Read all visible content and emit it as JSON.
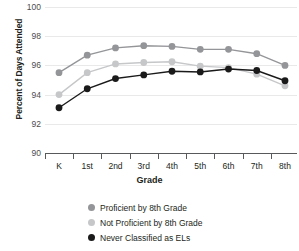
{
  "chart_data": {
    "type": "line",
    "title": "",
    "xlabel": "Grade",
    "ylabel": "Percent of Days Attended",
    "categories": [
      "K",
      "1st",
      "2nd",
      "3rd",
      "4th",
      "5th",
      "6th",
      "7th",
      "8th"
    ],
    "ylim": [
      90,
      100
    ],
    "yticks": [
      90,
      92,
      94,
      96,
      98,
      100
    ],
    "grid": true,
    "legend_position": "bottom",
    "series": [
      {
        "name": "Proficient by 8th Grade",
        "color": "#949598",
        "values": [
          95.5,
          96.7,
          97.2,
          97.35,
          97.3,
          97.1,
          97.1,
          96.8,
          96.0
        ]
      },
      {
        "name": "Not Proficient by 8th Grade",
        "color": "#c6c7c9",
        "values": [
          94.0,
          95.5,
          96.1,
          96.2,
          96.25,
          95.95,
          95.85,
          95.4,
          94.6
        ]
      },
      {
        "name": "Never Classified as ELs",
        "color": "#1a1a1a",
        "values": [
          93.1,
          94.4,
          95.1,
          95.35,
          95.6,
          95.55,
          95.75,
          95.65,
          94.95
        ]
      }
    ]
  },
  "axes": {
    "y_title": "Percent of Days Attended",
    "x_title": "Grade",
    "y_tick_labels": [
      "100",
      "98",
      "96",
      "94",
      "92",
      "90"
    ],
    "x_tick_labels": [
      "K",
      "1st",
      "2nd",
      "3rd",
      "4th",
      "5th",
      "6th",
      "7th",
      "8th"
    ]
  },
  "legend": {
    "items": [
      {
        "label": "Proficient by 8th Grade",
        "color": "#949598"
      },
      {
        "label": "Not Proficient by 8th Grade",
        "color": "#c6c7c9"
      },
      {
        "label": "Never Classified as ELs",
        "color": "#1a1a1a"
      }
    ]
  },
  "colors": {
    "grid": "#e9e9ea",
    "axis": "#58595b",
    "text": "#231f20",
    "tick_text": "#4d4d4f"
  }
}
